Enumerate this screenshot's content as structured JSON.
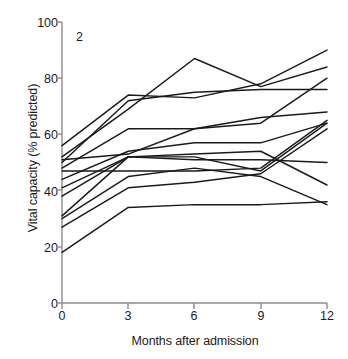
{
  "chart_data": {
    "type": "line",
    "title": "",
    "panel_label": "2",
    "xlabel": "Months after admission",
    "ylabel": "Vital capacity (% predicted)",
    "x": [
      0,
      3,
      6,
      9,
      12
    ],
    "xticks": [
      "0",
      "3",
      "6",
      "9",
      "12"
    ],
    "yticks": [
      "0",
      "20",
      "40",
      "60",
      "80",
      "100"
    ],
    "xlim": [
      0,
      12
    ],
    "ylim": [
      0,
      100
    ],
    "grid": false,
    "legend": "none",
    "series": [
      {
        "name": "patient-1",
        "values": [
          56,
          74,
          73,
          78,
          90
        ]
      },
      {
        "name": "patient-2",
        "values": [
          52,
          69,
          87,
          77,
          84
        ]
      },
      {
        "name": "patient-3",
        "values": [
          51,
          53,
          62,
          64,
          80
        ]
      },
      {
        "name": "patient-4",
        "values": [
          50,
          72,
          75,
          76,
          76
        ]
      },
      {
        "name": "patient-5",
        "values": [
          48,
          62,
          62,
          66,
          68
        ]
      },
      {
        "name": "patient-6",
        "values": [
          47,
          47,
          47,
          48,
          65
        ]
      },
      {
        "name": "patient-7",
        "values": [
          44,
          54,
          57,
          57,
          64
        ]
      },
      {
        "name": "patient-8",
        "values": [
          41,
          52,
          52,
          47,
          64
        ]
      },
      {
        "name": "patient-9",
        "values": [
          38,
          52,
          51,
          51,
          50
        ]
      },
      {
        "name": "patient-10",
        "values": [
          31,
          52,
          53,
          54,
          42
        ]
      },
      {
        "name": "patient-11",
        "values": [
          30,
          45,
          48,
          45,
          35
        ]
      },
      {
        "name": "patient-12",
        "values": [
          27,
          41,
          43,
          46,
          62
        ]
      },
      {
        "name": "patient-13",
        "values": [
          18,
          34,
          35,
          35,
          36
        ]
      }
    ]
  },
  "axes": {
    "plot_left_px": 62,
    "plot_right_px": 327,
    "plot_top_px": 22,
    "plot_bottom_px": 303
  }
}
